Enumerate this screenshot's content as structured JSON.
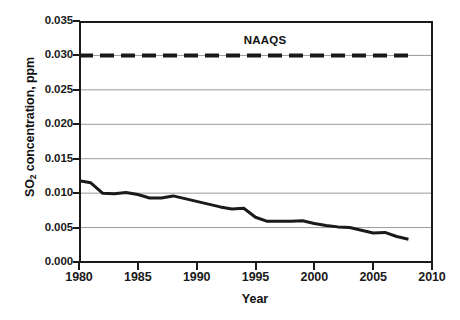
{
  "chart_data": {
    "type": "line",
    "title": "",
    "xlabel": "Year",
    "ylabel": "SO2 concentration, ppm",
    "ylabel_base": "SO",
    "ylabel_sub": "2",
    "ylabel_rest": " concentration, ppm",
    "xlim": [
      1980,
      2010
    ],
    "ylim": [
      0.0,
      0.035
    ],
    "grid": true,
    "legend": "none",
    "xticks": [
      1980,
      1985,
      1990,
      1995,
      2000,
      2005,
      2010
    ],
    "xtick_labels": [
      "1980",
      "1985",
      "1990",
      "1995",
      "2000",
      "2005",
      "2010"
    ],
    "yticks": [
      0.0,
      0.005,
      0.01,
      0.015,
      0.02,
      0.025,
      0.03,
      0.035
    ],
    "ytick_labels": [
      "0.000",
      "0.005",
      "0.010",
      "0.015",
      "0.020",
      "0.025",
      "0.030",
      "0.035"
    ],
    "annotations": [
      {
        "text": "NAAQS",
        "x": 1992.5,
        "y": 0.0325
      }
    ],
    "series": [
      {
        "name": "NAAQS",
        "style": "dashed",
        "color": "#1a1a1a",
        "width": 4,
        "x": [
          1980,
          2008
        ],
        "values": [
          0.03,
          0.03
        ]
      },
      {
        "name": "SO2 concentration",
        "style": "solid",
        "color": "#1a1a1a",
        "width": 3,
        "x": [
          1980,
          1981,
          1982,
          1983,
          1984,
          1985,
          1986,
          1987,
          1988,
          1989,
          1990,
          1991,
          1992,
          1993,
          1994,
          1995,
          1996,
          1997,
          1998,
          1999,
          2000,
          2001,
          2002,
          2003,
          2004,
          2005,
          2006,
          2007,
          2008
        ],
        "values": [
          0.0118,
          0.0115,
          0.01,
          0.0099,
          0.0101,
          0.0098,
          0.0093,
          0.0093,
          0.0096,
          0.0092,
          0.0088,
          0.0084,
          0.008,
          0.0077,
          0.0078,
          0.0065,
          0.0059,
          0.0059,
          0.0059,
          0.006,
          0.0056,
          0.0053,
          0.0051,
          0.005,
          0.0046,
          0.0042,
          0.0043,
          0.0037,
          0.0033
        ]
      }
    ]
  },
  "colors": {
    "ink": "#1a1a1a",
    "gridline": "#9a9a9a",
    "background": "#ffffff"
  }
}
